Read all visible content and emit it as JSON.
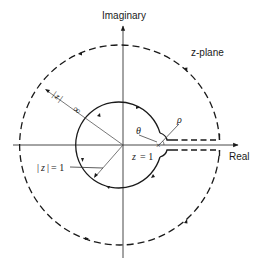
{
  "diagram": {
    "type": "contour-integration-keyhole",
    "plane_label": "z-plane",
    "axes": {
      "horizontal_label": "Real",
      "vertical_label": "Imaginary"
    },
    "labels": {
      "unit_circle": "|z| = 1",
      "unit_circle_parts": {
        "lhs_var": "z",
        "rhs": "= 1"
      },
      "outer_radius": "|z| → ∞",
      "outer_radius_parts": {
        "var": "z",
        "value": "∞"
      },
      "branch_point": "z = 1",
      "branch_point_parts": {
        "var": "z",
        "rhs": "= 1"
      },
      "angle": "θ",
      "small_radius": "ρ"
    },
    "contours": [
      {
        "name": "outer-circle",
        "style": "dashed",
        "radius": "∞",
        "direction": "counterclockwise"
      },
      {
        "name": "unit-circle",
        "style": "solid",
        "radius": 1,
        "direction": "clockwise"
      },
      {
        "name": "small-indent",
        "style": "solid",
        "radius": "ρ",
        "center": "z = 1"
      },
      {
        "name": "branch-cut",
        "style": "dashed",
        "from": "z = 1",
        "to": "∞"
      }
    ],
    "colors": {
      "stroke": "#1a1a1a",
      "background": "#ffffff"
    }
  }
}
